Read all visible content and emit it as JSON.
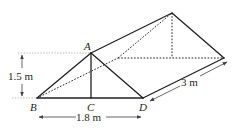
{
  "diagram": {
    "type": "triangular-prism",
    "vertices": {
      "A": "A",
      "B": "B",
      "C": "C",
      "D": "D"
    },
    "dimensions": {
      "height": "1.5 m",
      "base": "1.8 m",
      "length": "3 m"
    },
    "colors": {
      "line": "#231f20",
      "guide": "#a7a9ac",
      "dimension": "#414042"
    }
  }
}
